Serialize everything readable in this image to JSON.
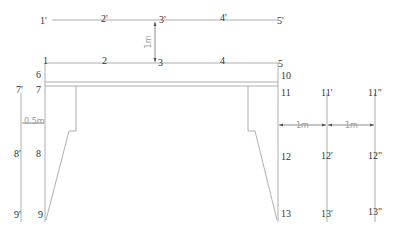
{
  "diagram": {
    "top_row_labels": [
      "1'",
      "2'",
      "3'",
      "4'",
      "5'"
    ],
    "main_row_labels": [
      "1",
      "2",
      "3",
      "4",
      "5"
    ],
    "left_labels": [
      "6",
      "7",
      "8",
      "9"
    ],
    "right_labels": [
      "10",
      "11",
      "12",
      "13"
    ],
    "left_offset_labels": [
      "7'",
      "8'",
      "9'"
    ],
    "right_offset1_labels": [
      "11'",
      "12'",
      "13'"
    ],
    "right_offset2_labels": [
      "11\"",
      "12\"",
      "13\""
    ],
    "dimensions": {
      "vertical_offset": "1m",
      "left_offset": "0.5m",
      "right_offset_1": "1m",
      "right_offset_2": "1m"
    }
  }
}
